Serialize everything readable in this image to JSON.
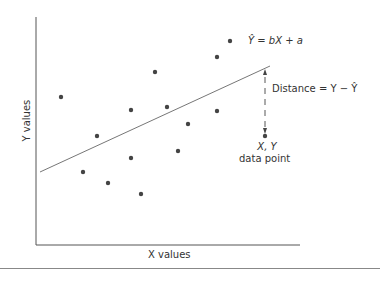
{
  "figure": {
    "equation_label": "Ŷ = bX + a",
    "distance_label": "Distance = Y − Ŷ",
    "point_label_line1": "X, Y",
    "point_label_line2": "data point",
    "x_axis_label": "X values",
    "y_axis_label": "Y values",
    "colors": {
      "axis": "#555555",
      "line": "#666666",
      "dot": "#444444",
      "text": "#333333"
    }
  },
  "chart_data": {
    "type": "scatter",
    "title": "",
    "xlabel": "X values",
    "ylabel": "Y values",
    "grid": false,
    "ticks": "none",
    "pixel_points": [
      [
        61,
        97
      ],
      [
        97,
        136
      ],
      [
        131,
        110
      ],
      [
        155,
        72
      ],
      [
        167,
        107
      ],
      [
        188,
        124
      ],
      [
        178,
        151
      ],
      [
        131,
        158
      ],
      [
        108,
        183
      ],
      [
        83,
        172
      ],
      [
        141,
        194
      ],
      [
        217,
        57
      ],
      [
        230,
        41
      ],
      [
        217,
        111
      ],
      [
        265,
        136
      ]
    ],
    "regression_line": {
      "label": "Ŷ = bX + a",
      "from": [
        40,
        172
      ],
      "to": [
        270,
        66
      ]
    },
    "highlighted_point": {
      "label": "X, Y data point",
      "pixel": [
        265,
        136
      ]
    },
    "residual_annotation": {
      "label": "Distance = Y − Ŷ",
      "from_pixel": [
        265,
        136
      ],
      "to_pixel": [
        265,
        68
      ]
    }
  }
}
